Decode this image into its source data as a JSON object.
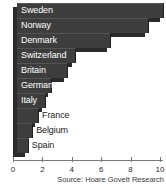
{
  "chart_data": {
    "type": "bar",
    "orientation": "horizontal",
    "title": "",
    "subtitle": "",
    "xlabel": "",
    "ylabel": "",
    "categories": [
      "Sweden",
      "Norway",
      "Denmark",
      "Switzerland",
      "Britain",
      "Germany",
      "Italy",
      "France",
      "Belgium",
      "Spain"
    ],
    "values": [
      10.0,
      9.0,
      6.4,
      4.0,
      3.5,
      2.4,
      2.0,
      1.5,
      1.1,
      0.8
    ],
    "label_placement": [
      "inside",
      "inside",
      "inside",
      "inside",
      "inside",
      "inside",
      "inside",
      "outside",
      "outside",
      "outside"
    ],
    "xlim": [
      0,
      10.2
    ],
    "ticks": [
      0,
      2,
      4,
      6,
      8,
      10
    ],
    "tick_labels": [
      "0",
      "2",
      "4",
      "6",
      "8",
      "10"
    ],
    "grid": false,
    "legend": null,
    "bar_color": "#3d3d3d",
    "bar_shadow_color": "#2b2b2b",
    "axis_color": "#7a7a7a"
  },
  "source": {
    "text": "Source: Hoare Govett Research"
  }
}
